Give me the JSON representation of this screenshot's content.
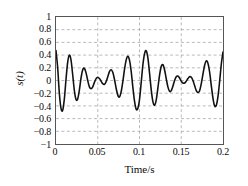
{
  "chart_data": {
    "type": "line",
    "title": "",
    "subtitle": "",
    "xlabel": "Time/s",
    "ylabel": "s(t)",
    "xlim": [
      0,
      0.2
    ],
    "ylim": [
      -1,
      1
    ],
    "grid": true,
    "legend": false,
    "legend_position": "none",
    "line_color": "#111111",
    "line_width": 1.6,
    "background_color": "#ffffff",
    "frame_color": "#555555",
    "grid_color": "#9a9a9a",
    "xticks": [
      0,
      0.05,
      0.1,
      0.15,
      0.2
    ],
    "xtick_labels": [
      "0",
      "0.05",
      "0.1",
      "0.15",
      "0.2"
    ],
    "yticks": [
      -1,
      -0.8,
      -0.6,
      -0.4,
      -0.2,
      0,
      0.2,
      0.4,
      0.6,
      0.8,
      1
    ],
    "ytick_labels": [
      "−1",
      "−0.8",
      "−0.6",
      "−0.4",
      "−0.2",
      "0",
      "0.2",
      "0.4",
      "0.6",
      "0.8",
      "1"
    ],
    "series": [
      {
        "name": "s(t)",
        "description": "Amplitude-modulated beating waveform: sum of two close-frequency sinusoids. Envelope nodes near t=0.05 and t=0.15, antinodes near t=0, 0.1 and 0.2. Peak amplitude about ±0.5.",
        "model": "0.25*sin(2*pi*100*t + 1.45) + 0.25*sin(2*pi*110*t + 1.45)",
        "x": [
          0,
          0.002,
          0.004,
          0.006,
          0.008,
          0.01,
          0.012,
          0.014,
          0.016,
          0.018,
          0.02,
          0.022,
          0.024,
          0.026,
          0.028,
          0.03,
          0.032,
          0.034,
          0.036,
          0.038,
          0.04,
          0.042,
          0.044,
          0.046,
          0.048,
          0.05,
          0.052,
          0.054,
          0.056,
          0.058,
          0.06,
          0.062,
          0.064,
          0.066,
          0.068,
          0.07,
          0.072,
          0.074,
          0.076,
          0.078,
          0.08,
          0.082,
          0.084,
          0.086,
          0.088,
          0.09,
          0.092,
          0.094,
          0.096,
          0.098,
          0.1,
          0.102,
          0.104,
          0.106,
          0.108,
          0.11,
          0.112,
          0.114,
          0.116,
          0.118,
          0.12,
          0.122,
          0.124,
          0.126,
          0.128,
          0.13,
          0.132,
          0.134,
          0.136,
          0.138,
          0.14,
          0.142,
          0.144,
          0.146,
          0.148,
          0.15,
          0.152,
          0.154,
          0.156,
          0.158,
          0.16,
          0.162,
          0.164,
          0.166,
          0.168,
          0.17,
          0.172,
          0.174,
          0.176,
          0.178,
          0.18,
          0.182,
          0.184,
          0.186,
          0.188,
          0.19,
          0.192,
          0.194,
          0.196,
          0.198,
          0.2
        ],
        "y": [
          0.47,
          0.2,
          -0.2,
          -0.44,
          -0.47,
          -0.29,
          0.02,
          0.29,
          0.4,
          0.32,
          0.09,
          -0.16,
          -0.3,
          -0.29,
          -0.15,
          0.04,
          0.17,
          0.19,
          0.12,
          0.0,
          -0.1,
          -0.13,
          -0.1,
          -0.03,
          0.03,
          0.05,
          0.03,
          -0.01,
          -0.05,
          -0.06,
          -0.02,
          0.06,
          0.14,
          0.17,
          0.13,
          0.02,
          -0.12,
          -0.23,
          -0.26,
          -0.18,
          -0.02,
          0.17,
          0.32,
          0.38,
          0.32,
          0.15,
          -0.1,
          -0.32,
          -0.45,
          -0.44,
          -0.3,
          -0.04,
          0.24,
          0.42,
          0.47,
          0.36,
          0.12,
          -0.14,
          -0.33,
          -0.39,
          -0.31,
          -0.12,
          0.08,
          0.22,
          0.25,
          0.17,
          0.03,
          -0.1,
          -0.17,
          -0.16,
          -0.09,
          0.0,
          0.06,
          0.07,
          0.04,
          -0.01,
          -0.04,
          -0.04,
          -0.01,
          0.03,
          0.06,
          0.05,
          0.0,
          -0.08,
          -0.16,
          -0.19,
          -0.16,
          -0.05,
          0.1,
          0.24,
          0.31,
          0.27,
          0.13,
          -0.08,
          -0.28,
          -0.4,
          -0.39,
          -0.25,
          -0.01,
          0.26,
          0.45
        ]
      }
    ]
  }
}
